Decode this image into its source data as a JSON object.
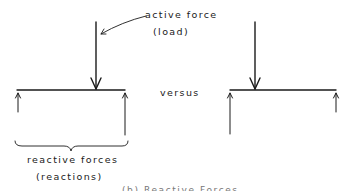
{
  "diagram": {
    "left_panel": {
      "load_label": "active force",
      "load_sublabel": "(load)",
      "reaction_label": "reactive forces",
      "reaction_sublabel": "(reactions)"
    },
    "separator_label": "versus",
    "caption": "(b) Reactive Forces",
    "colors": {
      "ink": "#1a1a1a",
      "background": "#ffffff"
    },
    "elements": [
      {
        "id": "left-beam",
        "type": "beam"
      },
      {
        "id": "left-load-arrow",
        "type": "arrow-down"
      },
      {
        "id": "left-reaction-left",
        "type": "arrow-up"
      },
      {
        "id": "left-reaction-right",
        "type": "arrow-up"
      },
      {
        "id": "right-beam",
        "type": "beam"
      },
      {
        "id": "right-load-arrow",
        "type": "arrow-down"
      },
      {
        "id": "right-reaction-left",
        "type": "arrow-up"
      },
      {
        "id": "right-reaction-right",
        "type": "arrow-up"
      },
      {
        "id": "reaction-brace",
        "type": "brace"
      },
      {
        "id": "label-leader-arrow",
        "type": "leader"
      }
    ]
  }
}
